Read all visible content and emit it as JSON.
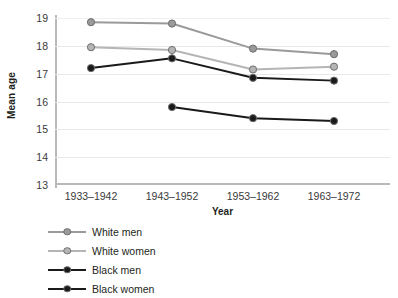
{
  "chart_data": {
    "type": "line",
    "title": "",
    "subtitle": "",
    "xlabel": "Year",
    "ylabel": "Mean age",
    "categories": [
      "1933–1942",
      "1943–1952",
      "1953–1962",
      "1963–1972"
    ],
    "ylim": [
      13,
      19
    ],
    "yticks": [
      13,
      14,
      15,
      16,
      17,
      18,
      19
    ],
    "ytick_labels": [
      "13",
      "14",
      "15",
      "16",
      "17",
      "18",
      "19"
    ],
    "grid": true,
    "grid_axis": "y",
    "legend_position": "below-left",
    "series": [
      {
        "name": "White men",
        "color": "#9a9a9a",
        "values": [
          18.85,
          18.8,
          17.9,
          17.7
        ]
      },
      {
        "name": "White women",
        "color": "#b5b5b5",
        "values": [
          17.95,
          17.85,
          17.15,
          17.25
        ]
      },
      {
        "name": "Black men",
        "color": "#1a1a1a",
        "values": [
          17.2,
          17.55,
          16.85,
          16.75
        ]
      },
      {
        "name": "Black women",
        "color": "#1a1a1a",
        "values": [
          null,
          15.8,
          15.4,
          15.3
        ]
      }
    ]
  },
  "axes": {
    "y_title": "Mean age",
    "x_title": "Year",
    "y_tick_0": "13",
    "y_tick_1": "14",
    "y_tick_2": "15",
    "y_tick_3": "16",
    "y_tick_4": "17",
    "y_tick_5": "18",
    "y_tick_6": "19",
    "x_tick_0": "1933–1942",
    "x_tick_1": "1943–1952",
    "x_tick_2": "1953–1962",
    "x_tick_3": "1963–1972"
  },
  "legend": {
    "items": [
      {
        "label": "White men"
      },
      {
        "label": "White women"
      },
      {
        "label": "Black men"
      },
      {
        "label": "Black women"
      }
    ]
  }
}
